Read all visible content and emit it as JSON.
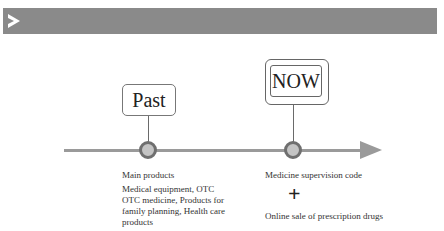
{
  "header": {
    "icon": "double-triangle-play-icon",
    "bar_color": "#8a8a8a"
  },
  "timeline": {
    "line_color": "#9a9a9a",
    "node_fill": "#c4c4c4",
    "node_border": "#6f6f6f",
    "past": {
      "label": "Past",
      "title": "Main products",
      "description": "Medical equipment, OTC OTC medicine, Products for family planning, Health care products"
    },
    "now": {
      "label": "NOW",
      "item1": "Medicine supervision code",
      "plus": "+",
      "item2": "Online sale of prescription drugs"
    }
  }
}
